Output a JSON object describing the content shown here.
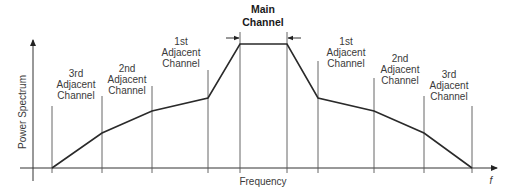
{
  "diagram": {
    "title": "Main Channel",
    "main_channel": {
      "label_line1": "Main",
      "label_line2": "Channel"
    },
    "y_axis_label": "Power Spectrum",
    "x_axis_label": "Frequency",
    "x_axis_symbol": "f",
    "left_channels": [
      {
        "line1": "3rd",
        "line2": "Adjacent",
        "line3": "Channel"
      },
      {
        "line1": "2nd",
        "line2": "Adjacent",
        "line3": "Channel"
      },
      {
        "line1": "1st",
        "line2": "Adjacent",
        "line3": "Channel"
      }
    ],
    "right_channels": [
      {
        "line1": "1st",
        "line2": "Adjacent",
        "line3": "Channel"
      },
      {
        "line1": "2nd",
        "line2": "Adjacent",
        "line3": "Channel"
      },
      {
        "line1": "3rd",
        "line2": "Adjacent",
        "line3": "Channel"
      }
    ],
    "colors": {
      "curve": "#2a2a2a",
      "gridline": "#555555",
      "text": "#3a3a3a"
    }
  }
}
